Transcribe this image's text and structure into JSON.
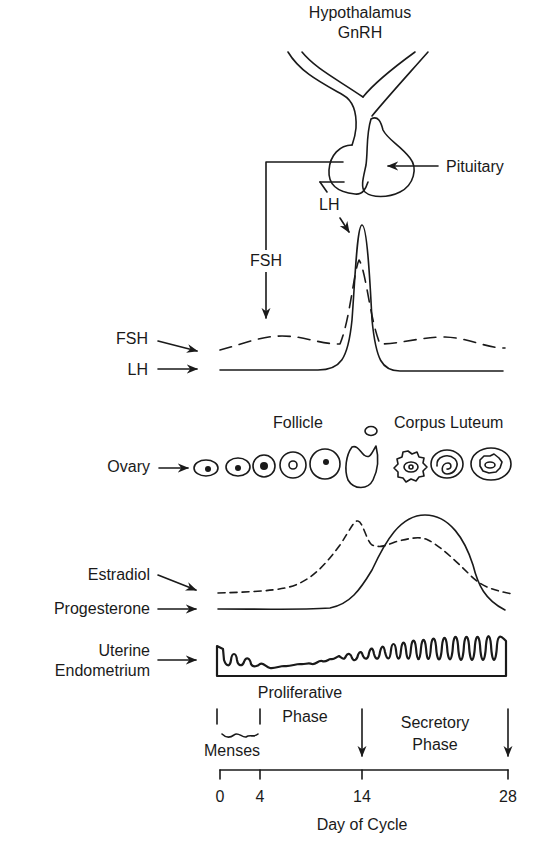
{
  "figure": {
    "title_top": "Hypothalamus",
    "hormone_top": "GnRH",
    "pituitary_label": "Pituitary",
    "fsh_arrow_label": "FSH",
    "lh_arrow_label": "LH"
  },
  "gonadotropins": {
    "fsh_label": "FSH",
    "lh_label": "LH",
    "fsh_style": "dashed",
    "lh_style": "solid"
  },
  "ovary": {
    "row_label": "Ovary",
    "follicle_label": "Follicle",
    "corpus_luteum_label": "Corpus Luteum",
    "stages": [
      "primordial",
      "primary",
      "secondary",
      "antral",
      "preovulatory",
      "ovulation",
      "early corpus luteum",
      "mid corpus luteum",
      "late corpus luteum"
    ]
  },
  "steroids": {
    "estradiol_label": "Estradiol",
    "progesterone_label": "Progesterone",
    "estradiol_style": "dashed",
    "progesterone_style": "solid"
  },
  "endometrium": {
    "label_line1": "Uterine",
    "label_line2": "Endometrium"
  },
  "phases": {
    "proliferative_line1": "Proliferative",
    "proliferative_line2": "Phase",
    "secretory_line1": "Secretory",
    "secretory_line2": "Phase",
    "menses": "Menses"
  },
  "axis": {
    "ticks": [
      "0",
      "4",
      "14",
      "28"
    ],
    "xlabel": "Day of Cycle"
  },
  "colors": {
    "ink": "#1a1a1a",
    "background": "#ffffff"
  }
}
